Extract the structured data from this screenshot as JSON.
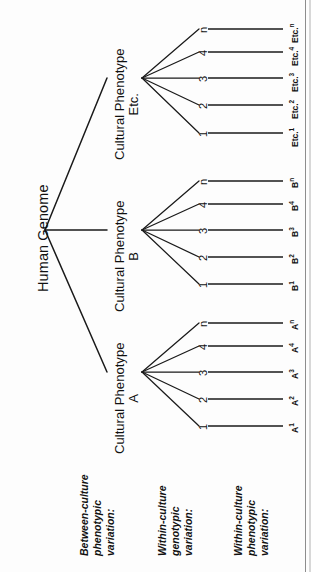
{
  "figure": {
    "type": "tree-diagram",
    "orientation": "rotated-90-ccw",
    "root": {
      "label": "Human Genome"
    },
    "branches": [
      {
        "id": "etc",
        "title": "Cultural Phenotype",
        "subtitle": "Etc.",
        "genotypes": [
          "1",
          "2",
          "3",
          "4",
          "n"
        ],
        "phenotypes": [
          {
            "base": "Etc.",
            "sup": "1"
          },
          {
            "base": "Etc.",
            "sup": "2"
          },
          {
            "base": "Etc.",
            "sup": "3"
          },
          {
            "base": "Etc.",
            "sup": "4"
          },
          {
            "base": "Etc.",
            "sup": "n"
          }
        ]
      },
      {
        "id": "b",
        "title": "Cultural Phenotype",
        "subtitle": "B",
        "genotypes": [
          "1",
          "2",
          "3",
          "4",
          "n"
        ],
        "phenotypes": [
          {
            "base": "B",
            "sup": "1"
          },
          {
            "base": "B",
            "sup": "2"
          },
          {
            "base": "B",
            "sup": "3"
          },
          {
            "base": "B",
            "sup": "4"
          },
          {
            "base": "B",
            "sup": "n"
          }
        ]
      },
      {
        "id": "a",
        "title": "Cultural Phenotype",
        "subtitle": "A",
        "genotypes": [
          "1",
          "2",
          "3",
          "4",
          "n"
        ],
        "phenotypes": [
          {
            "base": "A",
            "sup": "1"
          },
          {
            "base": "A",
            "sup": "2"
          },
          {
            "base": "A",
            "sup": "3"
          },
          {
            "base": "A",
            "sup": "4"
          },
          {
            "base": "A",
            "sup": "n"
          }
        ]
      }
    ],
    "categories": [
      {
        "id": "between-culture",
        "lines": [
          "Between-culture",
          "phenotypic",
          "variation:"
        ]
      },
      {
        "id": "within-culture-genotypic",
        "lines": [
          "Within-culture",
          "genotypic",
          "variation:"
        ]
      },
      {
        "id": "within-culture-phenotypic",
        "lines": [
          "Within-culture",
          "phenotypic",
          "variation:"
        ]
      }
    ],
    "colors": {
      "ink": "#111111",
      "paper": "#fdfdfd",
      "rule": "#8d8d8d"
    }
  }
}
